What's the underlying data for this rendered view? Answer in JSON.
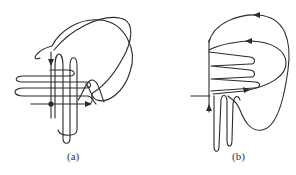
{
  "figure": {
    "panels": [
      {
        "id": "a",
        "label": "(a)",
        "description": "Homoclinic tangle: stable and unstable manifolds of a saddle point crossing with multiple oscillating lobes"
      },
      {
        "id": "b",
        "label": "(b)",
        "description": "Homoclinic tangle with manifold lobes accumulating on one side of the saddle"
      }
    ],
    "colors": {
      "stroke": "#2b2b2b",
      "background": "#ffffff"
    }
  }
}
